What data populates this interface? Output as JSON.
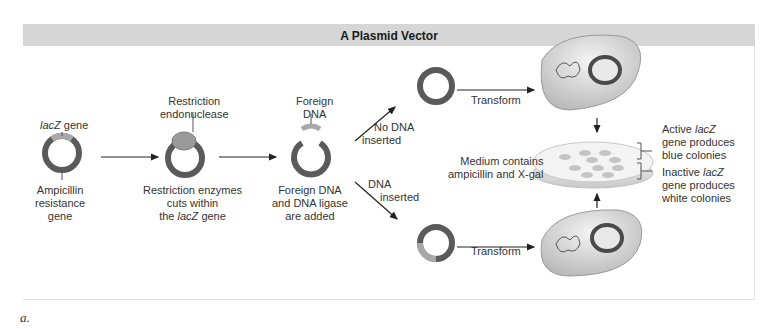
{
  "title": "A Plasmid Vector",
  "figure_label": "a.",
  "colors": {
    "title_bar": "#d6d6d6",
    "plasmid_ring": "#5a5a5a",
    "lacz_segment": "#a8a8a8",
    "text": "#333333"
  },
  "labels": {
    "lacz_gene_italic": "lacZ",
    "lacz_gene_rest": " gene",
    "ampicillin": [
      "Ampicillin",
      "resistance",
      "gene"
    ],
    "restriction_endonuclease": [
      "Restriction",
      "endonuclease"
    ],
    "restriction_cuts": [
      "Restriction enzymes",
      "cuts within"
    ],
    "restriction_cuts_line3_pre": "the ",
    "restriction_cuts_line3_italic": "lacZ",
    "restriction_cuts_line3_post": " gene",
    "foreign_dna": [
      "Foreign",
      "DNA"
    ],
    "foreign_dna_added": [
      "Foreign DNA",
      "and DNA ligase",
      "are added"
    ],
    "no_dna_inserted": [
      "No DNA",
      "inserted"
    ],
    "dna_inserted": [
      "DNA",
      "inserted"
    ],
    "transform_top": "Transform",
    "transform_bottom": "Transform",
    "medium": [
      "Medium contains",
      "ampicillin and X-gal"
    ],
    "active_line1_pre": "Active ",
    "active_line1_italic": "lacZ",
    "active_rest": [
      "gene produces",
      "blue colonies"
    ],
    "inactive_line1_pre": "Inactive ",
    "inactive_line1_italic": "lacZ",
    "inactive_rest": [
      "gene produces",
      "white colonies"
    ]
  }
}
